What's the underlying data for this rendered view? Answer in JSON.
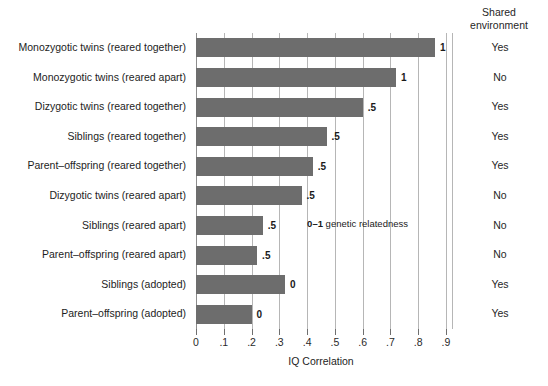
{
  "chart_data": {
    "type": "bar",
    "orientation": "horizontal",
    "title": "",
    "xlabel": "IQ Correlation",
    "ylabel": "",
    "xlim": [
      0,
      0.9
    ],
    "xticks": [
      "0",
      ".1",
      ".2",
      ".3",
      ".4",
      ".5",
      ".6",
      ".7",
      ".8",
      ".9"
    ],
    "xtick_values": [
      0,
      0.1,
      0.2,
      0.3,
      0.4,
      0.5,
      0.6,
      0.7,
      0.8,
      0.9
    ],
    "grid": true,
    "legend": "none",
    "categories": [
      "Monozygotic twins (reared together)",
      "Monozygotic twins (reared apart)",
      "Dizygotic twins (reared together)",
      "Siblings (reared together)",
      "Parent–offspring (reared together)",
      "Dizygotic twins (reared apart)",
      "Siblings (reared apart)",
      "Parent–offspring (reared apart)",
      "Siblings (adopted)",
      "Parent–offspring (adopted)"
    ],
    "values": [
      0.86,
      0.72,
      0.6,
      0.47,
      0.42,
      0.38,
      0.24,
      0.22,
      0.32,
      0.2
    ],
    "bar_labels": [
      "1",
      "1",
      ".5",
      ".5",
      ".5",
      ".5",
      ".5",
      ".5",
      "0",
      "0"
    ],
    "bar_label_meaning": "genetic relatedness",
    "annotation": {
      "number": "0–1",
      "text": " genetic relatedness"
    },
    "bar_color": "#6d6d6d",
    "grid_color": "#b6b6b6"
  },
  "env_column": {
    "header_line1": "Shared",
    "header_line2": "environment",
    "values": [
      "Yes",
      "No",
      "Yes",
      "Yes",
      "Yes",
      "No",
      "No",
      "No",
      "Yes",
      "Yes"
    ]
  }
}
